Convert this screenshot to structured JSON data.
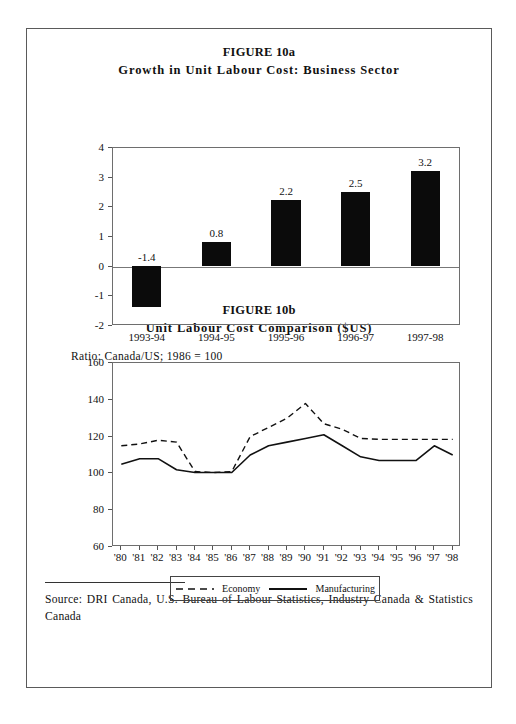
{
  "page": {
    "figure_a": {
      "title_line1": "FIGURE 10a",
      "title_line2": "Growth in Unit Labour Cost: Business Sector"
    },
    "figure_b": {
      "title_line1": "FIGURE 10b",
      "title_line2": "Unit Labour Cost Comparison ($US)",
      "ratio_note": "Ratio: Canada/US; 1986  =  100"
    },
    "source": {
      "text": "Source: DRI Canada, U.S. Bureau of Labour Statistics, Industry Canada & Statistics Canada"
    }
  },
  "chart_data": [
    {
      "type": "bar",
      "title": "Growth in Unit Labour Cost: Business Sector",
      "xlabel": "",
      "ylabel": "",
      "ylim": [
        -2,
        4
      ],
      "yticks": [
        4,
        3,
        2,
        1,
        0,
        -1,
        -2
      ],
      "grid": false,
      "bar_color": "#0b0b0b",
      "categories": [
        "1993-94",
        "1994-95",
        "1995-96",
        "1996-97",
        "1997-98"
      ],
      "values": [
        -1.4,
        0.8,
        2.2,
        2.5,
        3.2
      ],
      "data_labels": [
        "-1.4",
        "0.8",
        "2.2",
        "2.5",
        "3.2"
      ]
    },
    {
      "type": "line",
      "title": "Unit Labour Cost Comparison ($US)",
      "subtitle": "Ratio: Canada/US; 1986  =  100",
      "xlabel": "",
      "ylabel": "",
      "ylim": [
        60,
        160
      ],
      "yticks": [
        160,
        140,
        120,
        100,
        80,
        60
      ],
      "grid": false,
      "legend_position": "bottom",
      "x": [
        "'80",
        "'81",
        "'82",
        "'83",
        "'84",
        "'85",
        "'86",
        "'87",
        "'88",
        "'89",
        "'90",
        "'91",
        "'92",
        "'93",
        "'94",
        "'95",
        "'96",
        "'97",
        "'98"
      ],
      "series": [
        {
          "name": "Economy",
          "style": "dashed",
          "values": [
            115,
            116,
            118,
            117,
            101,
            100.5,
            101,
            120,
            125,
            130,
            138,
            127,
            124,
            119,
            118.5,
            118.5,
            118.5,
            118.5,
            118.5
          ]
        },
        {
          "name": "Manufacturing",
          "style": "solid",
          "values": [
            105,
            108,
            108,
            102,
            100.5,
            100.5,
            100.5,
            110,
            115,
            117,
            119,
            121,
            115,
            109,
            107,
            107,
            107,
            115,
            110
          ]
        }
      ]
    }
  ],
  "legend": {
    "economy_label": "Economy",
    "manufacturing_label": "Manufacturing"
  }
}
